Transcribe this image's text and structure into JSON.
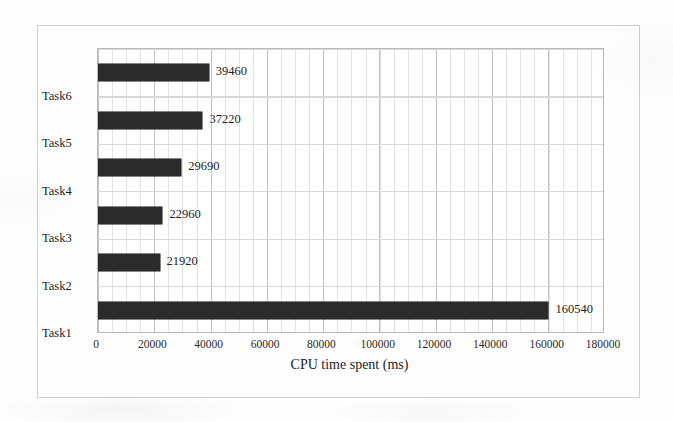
{
  "chart_data": {
    "type": "bar",
    "orientation": "horizontal",
    "title": "",
    "xlabel": "CPU time spent (ms)",
    "ylabel": "",
    "categories": [
      "Task1",
      "Task2",
      "Task3",
      "Task4",
      "Task5",
      "Task6"
    ],
    "values": [
      160540,
      21920,
      22960,
      29690,
      37220,
      39460
    ],
    "data_labels": [
      "160540",
      "21920",
      "22960",
      "29690",
      "37220",
      "39460"
    ],
    "series": [
      {
        "name": "CPU time spent (ms)",
        "values": [
          160540,
          21920,
          22960,
          29690,
          37220,
          39460
        ]
      }
    ],
    "xlim": [
      0,
      180000
    ],
    "x_tick_labels": [
      "0",
      "20000",
      "40000",
      "60000",
      "80000",
      "100000",
      "120000",
      "140000",
      "160000",
      "180000"
    ],
    "x_tick_values": [
      0,
      20000,
      40000,
      60000,
      80000,
      100000,
      120000,
      140000,
      160000,
      180000
    ],
    "x_major_step": 20000,
    "x_minor_step": 4000,
    "grid": true,
    "legend": false,
    "bar_color": "#2b2b2b",
    "plot_border_color": "#b9b9b9",
    "gridline_color": "#d8d8d8",
    "frame_color": "#cfcfcf",
    "category_order_top_to_bottom": [
      "Task6",
      "Task5",
      "Task4",
      "Task3",
      "Task2",
      "Task1"
    ]
  }
}
